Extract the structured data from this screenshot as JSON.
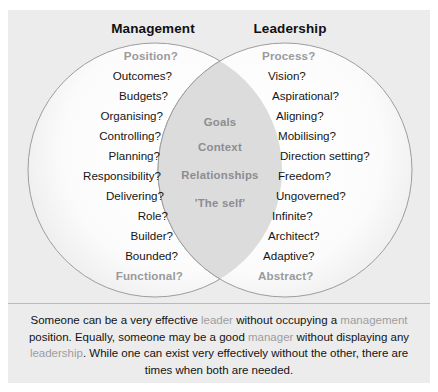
{
  "figure": {
    "type": "venn-diagram",
    "plate_color": "#ececed",
    "muted_text_color": "#9a9a9c",
    "body_text_color": "#141414"
  },
  "headings": {
    "left": "Management",
    "right": "Leadership"
  },
  "left_circle": {
    "label": "Management",
    "items": [
      {
        "text": "Position?",
        "muted": true
      },
      {
        "text": "Outcomes?",
        "muted": false
      },
      {
        "text": "Budgets?",
        "muted": false
      },
      {
        "text": "Organising?",
        "muted": false
      },
      {
        "text": "Controlling?",
        "muted": false
      },
      {
        "text": "Planning?",
        "muted": false
      },
      {
        "text": "Responsibility?",
        "muted": false
      },
      {
        "text": "Delivering?",
        "muted": false
      },
      {
        "text": "Role?",
        "muted": false
      },
      {
        "text": "Builder?",
        "muted": false
      },
      {
        "text": "Bounded?",
        "muted": false
      },
      {
        "text": "Functional?",
        "muted": true
      }
    ]
  },
  "right_circle": {
    "label": "Leadership",
    "items": [
      {
        "text": "Process?",
        "muted": true
      },
      {
        "text": "Vision?",
        "muted": false
      },
      {
        "text": "Aspirational?",
        "muted": false
      },
      {
        "text": "Aligning?",
        "muted": false
      },
      {
        "text": "Mobilising?",
        "muted": false
      },
      {
        "text": "Direction setting?",
        "muted": false
      },
      {
        "text": "Freedom?",
        "muted": false
      },
      {
        "text": "Ungoverned?",
        "muted": false
      },
      {
        "text": "Infinite?",
        "muted": false
      },
      {
        "text": "Architect?",
        "muted": false
      },
      {
        "text": "Adaptive?",
        "muted": false
      },
      {
        "text": "Abstract?",
        "muted": true
      }
    ]
  },
  "overlap": {
    "items": [
      "Goals",
      "Context",
      "Relationships",
      "'The self'"
    ]
  },
  "caption": {
    "segments": [
      {
        "text": "Someone can be a very effective ",
        "highlight": false
      },
      {
        "text": "leader",
        "highlight": true
      },
      {
        "text": " without occupying a ",
        "highlight": false
      },
      {
        "text": "management",
        "highlight": true
      },
      {
        "text": " position. Equally, someone may be a good ",
        "highlight": false
      },
      {
        "text": "manager",
        "highlight": true
      },
      {
        "text": " without displaying any ",
        "highlight": false
      },
      {
        "text": "leadership",
        "highlight": true
      },
      {
        "text": ". While one can exist very effectively without the other, there are times when both are needed.",
        "highlight": false
      }
    ]
  }
}
